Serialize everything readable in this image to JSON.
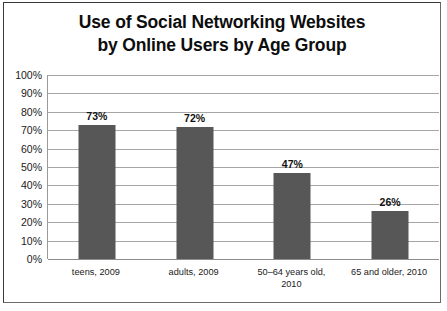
{
  "chart_data": {
    "type": "bar",
    "title": "Use of Social Networking Websites by Online Users by Age Group",
    "title_lines": [
      "Use of Social Networking Websites",
      "by Online Users by Age Group"
    ],
    "categories": [
      "teens, 2009",
      "adults, 2009",
      "50–64 years old, 2010",
      "65 and older, 2010"
    ],
    "category_lines": [
      [
        "teens, 2009"
      ],
      [
        "adults, 2009"
      ],
      [
        "50–64 years old,",
        "2010"
      ],
      [
        "65 and older, 2010"
      ]
    ],
    "values": [
      73,
      72,
      47,
      26
    ],
    "value_labels": [
      "73%",
      "72%",
      "47%",
      "26%"
    ],
    "xlabel": "",
    "ylabel": "",
    "ylim": [
      0,
      100
    ],
    "ytick_values": [
      100,
      90,
      80,
      70,
      60,
      50,
      40,
      30,
      20,
      10,
      0
    ],
    "ytick_labels": [
      "100%",
      "90%",
      "80%",
      "70%",
      "60%",
      "50%",
      "40%",
      "30%",
      "20%",
      "10%",
      "0%"
    ],
    "grid": true,
    "legend": false,
    "legend_position": "none",
    "bar_color": "#575757",
    "gridline_color": "#a6a6a6",
    "plot_background": "#ffffff",
    "text_color": "#1a1a1a",
    "border_color": "#3a3a3a"
  }
}
